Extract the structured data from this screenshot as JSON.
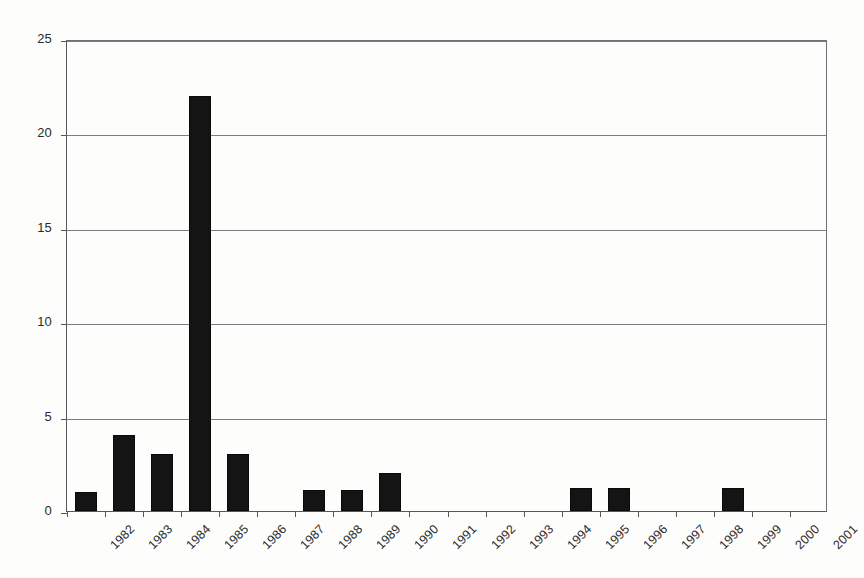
{
  "chart_data": {
    "type": "bar",
    "title": "",
    "subtitle": "",
    "xlabel": "",
    "ylabel": "",
    "categories": [
      "1982",
      "1983",
      "1984",
      "1985",
      "1986",
      "1987",
      "1988",
      "1989",
      "1990",
      "1991",
      "1992",
      "1993",
      "1994",
      "1995",
      "1996",
      "1997",
      "1998",
      "1999",
      "2000",
      "2001"
    ],
    "values": [
      1,
      4,
      3,
      22,
      3,
      0,
      1.1,
      1.1,
      2,
      0,
      0,
      0,
      0,
      1.2,
      1.2,
      0,
      0,
      1.2,
      0,
      0
    ],
    "series": [
      {
        "name": "count",
        "values": [
          1,
          4,
          3,
          22,
          3,
          0,
          1.1,
          1.1,
          2,
          0,
          0,
          0,
          0,
          1.2,
          1.2,
          0,
          0,
          1.2,
          0,
          0
        ]
      }
    ],
    "ylim": [
      0,
      25
    ],
    "yticks": [
      0,
      5,
      10,
      15,
      20,
      25
    ],
    "ytick_labels": [
      "0",
      "5",
      "10",
      "15",
      "20",
      "25"
    ],
    "grid": "horizontal",
    "legend": "none",
    "bar_color": "#141414",
    "axis_color": "#55595c",
    "grid_color": "#7a7e81",
    "background": "#fdfdfc",
    "xtick_label_rotation": -45
  },
  "accessibility": {
    "figure_role": "bar-chart",
    "description": "Vertical bar chart of yearly counts from 1982 to 2001 with a tall peak of 22 at 1985"
  }
}
